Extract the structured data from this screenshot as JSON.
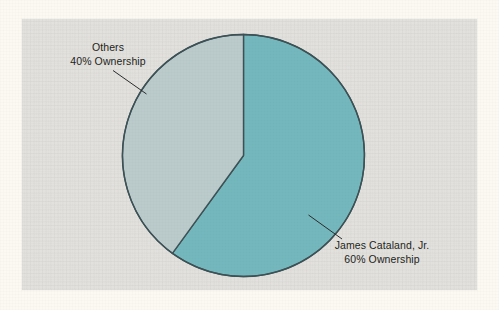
{
  "chart_data": {
    "type": "pie",
    "title": "",
    "subtitle": "",
    "xlabel": "",
    "ylabel": "",
    "legend_position": "none",
    "grid": false,
    "total": 100,
    "unit": "%",
    "slices": [
      {
        "name": "James Cataland, Jr.",
        "label_line1": "James Cataland, Jr.",
        "label_line2": "60% Ownership",
        "value": 60,
        "percent": 60,
        "color": "#74b8be",
        "start_angle_deg": 0,
        "end_angle_deg": 216,
        "label_position": "lower-right"
      },
      {
        "name": "Others",
        "label_line1": "Others",
        "label_line2": "40% Ownership",
        "value": 40,
        "percent": 40,
        "color": "#bbcbcc",
        "start_angle_deg": 216,
        "end_angle_deg": 360,
        "label_position": "upper-left"
      }
    ],
    "geometry": {
      "center_x": 243.5,
      "center_y": 155.5,
      "radius": 121,
      "outline_color": "#3d5256",
      "outline_width": 1.4
    }
  },
  "panel": {
    "background_color": "#e3e1dd",
    "page_background_color": "#fbf9f2"
  },
  "labels": {
    "others": {
      "line1": "Others",
      "line2": "40% Ownership"
    },
    "owner": {
      "line1": "James Cataland, Jr.",
      "line2": "60% Ownership"
    }
  }
}
